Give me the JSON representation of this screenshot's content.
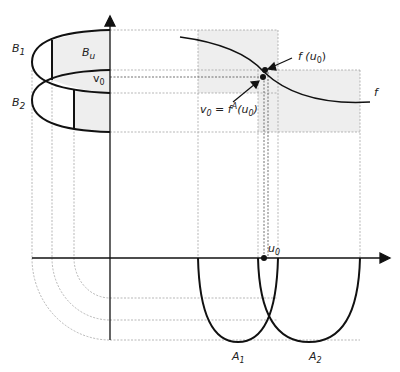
{
  "diagram": {
    "type": "function composition diagram",
    "labels": {
      "B1": "B",
      "B1_sub": "1",
      "B2": "B",
      "B2_sub": "2",
      "Bu": "B",
      "Bu_sub": "u",
      "v0": "v",
      "v0_sub": "0",
      "f_u0_prefix": "f (u",
      "f_u0_sub": "0",
      "f_u0_suffix": ")",
      "v0_eq_prefix": "v",
      "v0_eq_sub": "0",
      "v0_eq_mid": " = f",
      "v0_eq_sup": "A",
      "v0_eq_paren": "(u",
      "v0_eq_sub2": "0",
      "v0_eq_close": ")",
      "f": "f",
      "u0": "u",
      "u0_sub": "0",
      "A1": "A",
      "A1_sub": "1",
      "A2": "A",
      "A2_sub": "2"
    },
    "colors": {
      "stroke": "#111111",
      "guide": "#999999",
      "shade": "#eeeeee"
    }
  }
}
